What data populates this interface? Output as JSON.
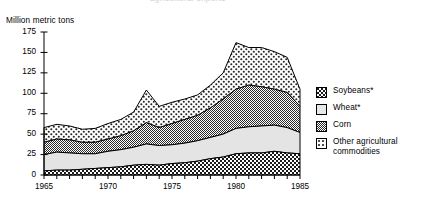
{
  "axis_title": "Million metric tons",
  "clipped_title": "agricultural exports",
  "legend": {
    "items": [
      {
        "label": "Soybeans*",
        "label2": "",
        "pattern": "dark-checker",
        "name": "legend-soybeans"
      },
      {
        "label": "Wheat*",
        "label2": "",
        "pattern": "plain-light",
        "name": "legend-wheat"
      },
      {
        "label": "Corn",
        "label2": "",
        "pattern": "dense-dark",
        "name": "legend-corn"
      },
      {
        "label": "Other agricultural",
        "label2": "commodities",
        "pattern": "light-dots",
        "name": "legend-other"
      }
    ]
  },
  "chart_data": {
    "type": "area",
    "title": "",
    "xlabel": "",
    "ylabel": "Million metric tons",
    "xlim": [
      1965,
      1985
    ],
    "ylim": [
      0,
      175
    ],
    "yticks": [
      0,
      25,
      50,
      75,
      100,
      125,
      150,
      175
    ],
    "xticks": [
      1965,
      1970,
      1975,
      1980,
      1985
    ],
    "xtick_labels": [
      "1965",
      "1970",
      "1975",
      "1980",
      "1985"
    ],
    "grid": false,
    "legend_position": "right",
    "stacked": true,
    "x": [
      1965,
      1966,
      1967,
      1968,
      1969,
      1970,
      1971,
      1972,
      1973,
      1974,
      1975,
      1976,
      1977,
      1978,
      1979,
      1980,
      1981,
      1982,
      1983,
      1984,
      1985
    ],
    "series": [
      {
        "name": "Soybeans*",
        "pattern": "dark-checker",
        "values": [
          5,
          6,
          6,
          7,
          8,
          9,
          10,
          12,
          13,
          12,
          14,
          15,
          17,
          20,
          22,
          26,
          27,
          27,
          29,
          27,
          26
        ]
      },
      {
        "name": "Wheat*",
        "pattern": "plain-light",
        "values": [
          20,
          22,
          21,
          19,
          18,
          20,
          21,
          22,
          25,
          24,
          23,
          24,
          25,
          26,
          28,
          31,
          32,
          33,
          32,
          31,
          26
        ]
      },
      {
        "name": "Corn",
        "pattern": "dense-dark",
        "values": [
          15,
          16,
          16,
          14,
          14,
          15,
          17,
          20,
          26,
          22,
          26,
          29,
          31,
          36,
          43,
          48,
          51,
          48,
          44,
          43,
          32
        ]
      },
      {
        "name": "Other agricultural commodities",
        "pattern": "light-dots",
        "values": [
          18,
          18,
          17,
          16,
          17,
          19,
          20,
          23,
          40,
          26,
          26,
          25,
          25,
          28,
          32,
          57,
          46,
          48,
          46,
          43,
          21
        ]
      }
    ],
    "totals": [
      58,
      62,
      60,
      56,
      57,
      63,
      68,
      77,
      104,
      84,
      89,
      93,
      98,
      110,
      125,
      162,
      156,
      156,
      151,
      144,
      105
    ]
  }
}
